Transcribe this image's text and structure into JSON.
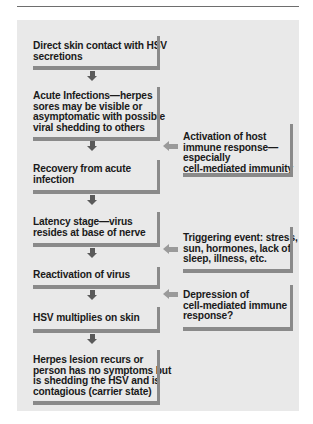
{
  "diagram": {
    "type": "flowchart",
    "main_flow": [
      {
        "id": "step-1",
        "lines": [
          "Direct skin contact with HSV",
          "secretions"
        ]
      },
      {
        "id": "step-2",
        "lines": [
          "Acute Infections—herpes",
          "sores may be visible or",
          "asymptomatic with possible",
          "viral shedding to others"
        ]
      },
      {
        "id": "step-3",
        "lines": [
          "Recovery from acute",
          "infection"
        ]
      },
      {
        "id": "step-4",
        "lines": [
          "Latency stage—virus",
          "resides at base of nerve"
        ]
      },
      {
        "id": "step-5",
        "lines": [
          "Reactivation of virus"
        ]
      },
      {
        "id": "step-6",
        "lines": [
          "HSV multiplies on skin"
        ]
      },
      {
        "id": "step-7",
        "lines": [
          "Herpes lesion recurs or",
          "person has no symptoms but",
          "is shedding the HSV and is",
          "contagious (carrier state)"
        ]
      }
    ],
    "side_factors": [
      {
        "id": "factor-immune-activation",
        "points_to_between": [
          "step-2",
          "step-3"
        ],
        "lines": [
          "Activation of host",
          "immune response—",
          "especially",
          "cell-mediated immunity"
        ]
      },
      {
        "id": "factor-triggering-event",
        "points_to_between": [
          "step-4",
          "step-5"
        ],
        "lines": [
          "Triggering event: stress,",
          "sun, hormones, lack of",
          "sleep, illness, etc."
        ]
      },
      {
        "id": "factor-immune-depression",
        "points_to_between": [
          "step-5",
          "step-6"
        ],
        "lines": [
          "Depression of",
          "cell-mediated immune",
          "response?"
        ]
      }
    ],
    "colors": {
      "panel_background": "#e9e9e9",
      "box_shadow_bars": "#8a8a8a",
      "down_arrows": "#5a5a5a",
      "side_arrows": "#9a9a9a",
      "text": "#1a1a1a"
    }
  },
  "text": {
    "s1": "Direct skin contact with HSV\nsecretions",
    "s2": "Acute Infections—herpes\nsores may be visible or\nasymptomatic with possible\nviral shedding to others",
    "s3": "Recovery from acute\ninfection",
    "s4": "Latency stage—virus\nresides at base of nerve",
    "s5": "Reactivation of virus",
    "s6": "HSV multiplies on skin",
    "s7": "Herpes lesion recurs or\nperson has no symptoms but\nis shedding the HSV and is\ncontagious (carrier state)",
    "f1": "Activation of host\nimmune response—\nespecially\ncell-mediated immunity",
    "f2": "Triggering event: stress,\nsun, hormones, lack of\nsleep, illness, etc.",
    "f3": "Depression of\ncell-mediated immune\nresponse?"
  }
}
